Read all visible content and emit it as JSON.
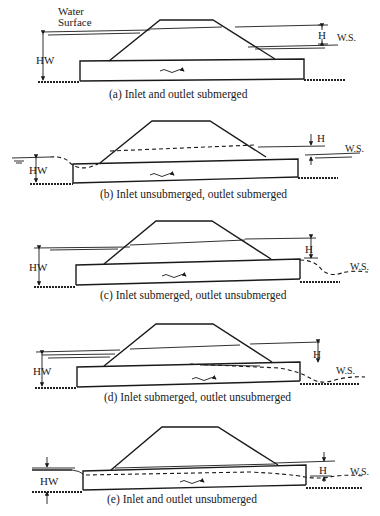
{
  "figure": {
    "panels": [
      {
        "id": "a",
        "caption": "(a) Inlet and outlet submerged",
        "labels": {
          "water_surface_line1": "Water",
          "water_surface_line2": "Surface",
          "hw": "HW",
          "h": "H",
          "ws": "W.S."
        }
      },
      {
        "id": "b",
        "caption": "(b) Inlet unsubmerged, outlet submerged",
        "labels": {
          "hw": "HW",
          "h": "H",
          "ws": "W.S."
        }
      },
      {
        "id": "c",
        "caption": "(c) Inlet submerged, outlet unsubmerged",
        "labels": {
          "hw": "HW",
          "h": "H",
          "ws": "W.S."
        }
      },
      {
        "id": "d",
        "caption": "(d) Inlet submerged, outlet unsubmerged",
        "labels": {
          "hw": "HW",
          "h": "H",
          "ws": "W.S."
        }
      },
      {
        "id": "e",
        "caption": "(e) Inlet and outlet unsubmerged",
        "labels": {
          "hw": "HW",
          "h": "H",
          "ws": "W.S."
        }
      }
    ]
  }
}
